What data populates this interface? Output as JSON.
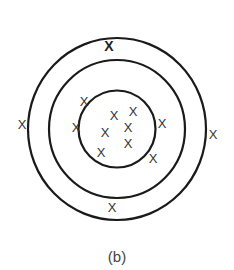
{
  "figure": {
    "caption": "(b)",
    "mark_glyph": "X",
    "center": [
      117,
      129
    ],
    "rings": [
      {
        "name": "outer-ring",
        "rx": 89,
        "ry": 91
      },
      {
        "name": "middle-ring",
        "rx": 68,
        "ry": 69
      },
      {
        "name": "inner-ring",
        "rx": 38.5,
        "ry": 38.5
      }
    ],
    "marks": [
      {
        "x": 109,
        "y": 46,
        "bold": true
      },
      {
        "x": 22,
        "y": 124
      },
      {
        "x": 213,
        "y": 134
      },
      {
        "x": 84,
        "y": 101
      },
      {
        "x": 76,
        "y": 127
      },
      {
        "x": 114,
        "y": 115
      },
      {
        "x": 133,
        "y": 111
      },
      {
        "x": 105,
        "y": 132
      },
      {
        "x": 128,
        "y": 127
      },
      {
        "x": 128,
        "y": 143
      },
      {
        "x": 101,
        "y": 152
      },
      {
        "x": 162,
        "y": 123
      },
      {
        "x": 153,
        "y": 158
      },
      {
        "x": 112,
        "y": 207
      }
    ],
    "colors": {
      "stroke": "#1a1a1a",
      "mark": "#333333",
      "caption": "#444444"
    }
  }
}
